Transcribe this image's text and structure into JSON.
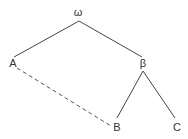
{
  "diagram": {
    "type": "tree",
    "nodes": [
      {
        "id": "omega",
        "label": "ω",
        "x": 78,
        "y": 16
      },
      {
        "id": "A",
        "label": "A",
        "x": 13,
        "y": 67
      },
      {
        "id": "beta",
        "label": "β",
        "x": 143,
        "y": 67
      },
      {
        "id": "B",
        "label": "B",
        "x": 117,
        "y": 131
      },
      {
        "id": "C",
        "label": "C",
        "x": 177,
        "y": 131
      }
    ],
    "edges": [
      {
        "from": "omega",
        "to": "A",
        "style": "solid"
      },
      {
        "from": "omega",
        "to": "beta",
        "style": "solid"
      },
      {
        "from": "beta",
        "to": "B",
        "style": "solid"
      },
      {
        "from": "beta",
        "to": "C",
        "style": "solid"
      },
      {
        "from": "A",
        "to": "B",
        "style": "dashed"
      }
    ]
  }
}
